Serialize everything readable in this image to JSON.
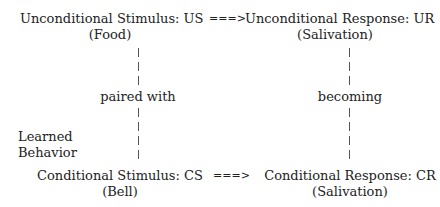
{
  "diagram": {
    "top_left": {
      "title": "Unconditional Stimulus: US",
      "sub": "(Food)"
    },
    "top_right": {
      "title": "Unconditional Response: UR",
      "sub": "(Salivation)"
    },
    "bottom_left": {
      "title": "Conditional Stimulus: CS",
      "sub": "(Bell)"
    },
    "bottom_right": {
      "title": "Conditional Response: CR",
      "sub": "(Salivation)"
    },
    "arrow_top": "===>",
    "arrow_bottom": "===>",
    "left_connector_label": "paired with",
    "right_connector_label": "becoming",
    "side_label_line1": "Learned",
    "side_label_line2": "Behavior"
  }
}
